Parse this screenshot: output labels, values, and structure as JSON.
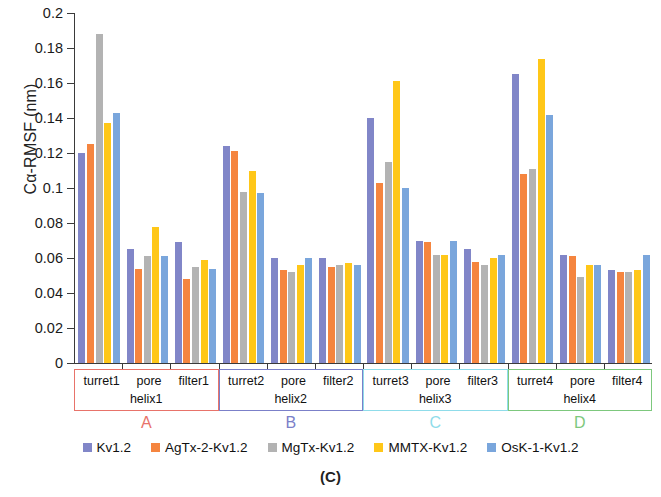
{
  "caption": "(C)",
  "axis": {
    "ylabel": "Cα-RMSF (nm)",
    "yticks": [
      "0",
      "0.02",
      "0.04",
      "0.06",
      "0.08",
      "0.1",
      "0.12",
      "0.14",
      "0.16",
      "0.18",
      "0.2"
    ]
  },
  "legend": [
    {
      "label": "Kv1.2",
      "color": "#8186c8"
    },
    {
      "label": "AgTx-2-Kv1.2",
      "color": "#f5853f"
    },
    {
      "label": "MgTx-Kv1.2",
      "color": "#b3b3b3"
    },
    {
      "label": "MMTX-Kv1.2",
      "color": "#ffc718"
    },
    {
      "label": "OsK-1-Kv1.2",
      "color": "#7aa6dc"
    }
  ],
  "groups": [
    {
      "letter": "A",
      "color": "#e8736a",
      "subs": [
        "turret1",
        "pore",
        "filter1"
      ],
      "helix": "helix1"
    },
    {
      "letter": "B",
      "color": "#7b80c9",
      "subs": [
        "turret2",
        "pore",
        "filter2"
      ],
      "helix": "helix2"
    },
    {
      "letter": "C",
      "color": "#8fdcea",
      "subs": [
        "turret3",
        "pore",
        "filter3"
      ],
      "helix": "helix3"
    },
    {
      "letter": "D",
      "color": "#7dc87d",
      "subs": [
        "turret4",
        "pore",
        "filter4"
      ],
      "helix": "helix4"
    }
  ],
  "chart_data": {
    "type": "bar",
    "title": "",
    "xlabel": "",
    "ylabel": "Cα-RMSF (nm)",
    "ylim": [
      0,
      0.2
    ],
    "ytick_step": 0.02,
    "grid": false,
    "legend_position": "bottom",
    "categories": [
      "turret1",
      "pore helix1",
      "filter1",
      "turret2",
      "pore helix2",
      "filter2",
      "turret3",
      "pore helix3",
      "filter3",
      "turret4",
      "pore helix4",
      "filter4"
    ],
    "series": [
      {
        "name": "Kv1.2",
        "color": "#8186c8",
        "values": [
          0.12,
          0.065,
          0.069,
          0.124,
          0.06,
          0.06,
          0.14,
          0.07,
          0.065,
          0.165,
          0.062,
          0.053
        ]
      },
      {
        "name": "AgTx-2-Kv1.2",
        "color": "#f5853f",
        "values": [
          0.125,
          0.054,
          0.048,
          0.121,
          0.053,
          0.055,
          0.103,
          0.069,
          0.058,
          0.108,
          0.061,
          0.052
        ]
      },
      {
        "name": "MgTx-Kv1.2",
        "color": "#b3b3b3",
        "values": [
          0.188,
          0.061,
          0.055,
          0.098,
          0.052,
          0.056,
          0.115,
          0.062,
          0.056,
          0.111,
          0.049,
          0.052
        ]
      },
      {
        "name": "MMTX-Kv1.2",
        "color": "#ffc718",
        "values": [
          0.137,
          0.078,
          0.059,
          0.11,
          0.056,
          0.057,
          0.161,
          0.062,
          0.06,
          0.174,
          0.056,
          0.053
        ]
      },
      {
        "name": "OsK-1-Kv1.2",
        "color": "#7aa6dc",
        "values": [
          0.143,
          0.061,
          0.054,
          0.097,
          0.06,
          0.056,
          0.1,
          0.07,
          0.062,
          0.142,
          0.056,
          0.062
        ]
      }
    ]
  }
}
